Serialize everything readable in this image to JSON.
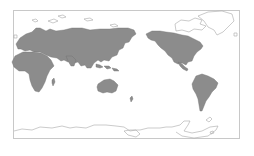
{
  "map": {
    "projection": "Pacific-centered equirectangular world map",
    "colors": {
      "background": "#ffffff",
      "frame": "#c8c8c8",
      "shaded_region": "#8c8c8c",
      "shaded_border": "#6e6e6e",
      "unshaded_outline": "#a8a8a8"
    },
    "shaded_regions": [
      "Europe",
      "Africa",
      "Asia (excluding arctic)",
      "Indonesia",
      "Australia",
      "New Zealand",
      "North America (excluding arctic)",
      "Central America",
      "South America"
    ],
    "unshaded_regions": [
      "Arctic islands",
      "Greenland",
      "Antarctica",
      "Tierra del Fuego"
    ]
  }
}
